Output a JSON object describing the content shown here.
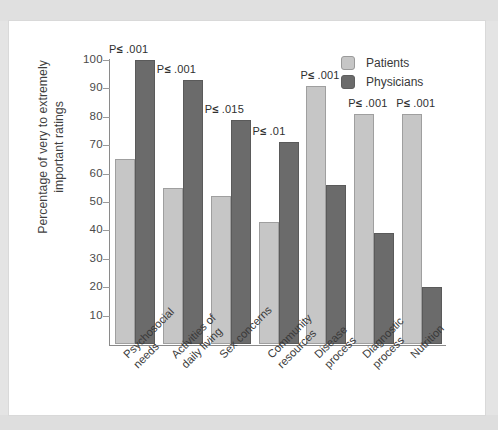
{
  "chart_data": {
    "type": "bar",
    "title": "",
    "xlabel": "",
    "ylabel": "Percentage of very to extremely important ratings",
    "ylabel_line1": "Percentage of very to extremely",
    "ylabel_line2": "important ratings",
    "ylim": [
      0,
      100
    ],
    "yticks": [
      10,
      20,
      30,
      40,
      50,
      60,
      70,
      80,
      90,
      100
    ],
    "grid": false,
    "legend_position": "top-right",
    "categories": [
      "Psychosocial needs",
      "Activities of daily living",
      "Sex concerns",
      "Community resources",
      "Disease process",
      "Diagnostic process",
      "Nutrition"
    ],
    "category_lines": [
      [
        "Psychosocial",
        "needs"
      ],
      [
        "Activities of",
        "daily living"
      ],
      [
        "Sex concerns",
        ""
      ],
      [
        "Community",
        "resources"
      ],
      [
        "Disease",
        "process"
      ],
      [
        "Diagnostic",
        "process"
      ],
      [
        "Nutrition",
        ""
      ]
    ],
    "series": [
      {
        "name": "Patients",
        "color": "#c6c6c6",
        "values": [
          65,
          55,
          52,
          43,
          91,
          81,
          81
        ]
      },
      {
        "name": "Physicians",
        "color": "#6b6b6b",
        "values": [
          100,
          93,
          79,
          71,
          56,
          39,
          20
        ]
      }
    ],
    "annotations": [
      "P≤ .001",
      "P≤ .001",
      "P≤ .015",
      "P≤ .01",
      "P≤ .001",
      "P≤ .001",
      "P≤ .001"
    ],
    "annotation_parts": [
      {
        "prefix": "P",
        "symbol": "≤",
        "value": " .001"
      },
      {
        "prefix": "P",
        "symbol": "≤",
        "value": " .001"
      },
      {
        "prefix": "P",
        "symbol": "≤",
        "value": " .015"
      },
      {
        "prefix": "P",
        "symbol": "≤",
        "value": " .01"
      },
      {
        "prefix": "P",
        "symbol": "≤",
        "value": " .001"
      },
      {
        "prefix": "P",
        "symbol": "≤",
        "value": " .001"
      },
      {
        "prefix": "P",
        "symbol": "≤",
        "value": " .001"
      }
    ]
  },
  "legend": {
    "items": [
      {
        "label": "Patients",
        "color": "#c6c6c6"
      },
      {
        "label": "Physicians",
        "color": "#6b6b6b"
      }
    ]
  },
  "colors": {
    "patients": "#c6c6c6",
    "physicians": "#6b6b6b",
    "axis": "#8a8a8a",
    "text": "#3a3a3a",
    "paper": "#ffffff",
    "page_border": "#e3e3e3"
  }
}
